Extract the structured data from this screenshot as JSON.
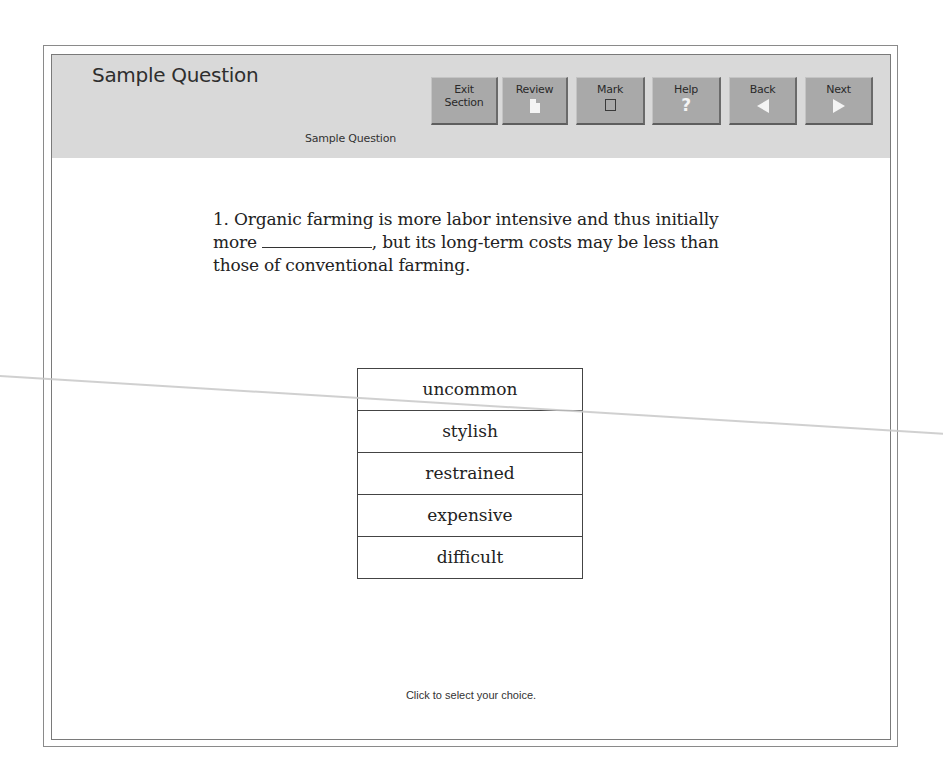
{
  "header": {
    "title": "Sample Question",
    "subtitle": "Sample Question"
  },
  "toolbar": {
    "buttons": [
      {
        "label_line1": "Exit",
        "label_line2": "Section",
        "icon": "none"
      },
      {
        "label": "Review",
        "icon": "document-icon"
      },
      {
        "label": "Mark",
        "icon": "checkbox-icon"
      },
      {
        "label": "Help",
        "icon": "question-mark-icon"
      },
      {
        "label": "Back",
        "icon": "arrow-left-icon"
      },
      {
        "label": "Next",
        "icon": "arrow-right-icon"
      }
    ]
  },
  "question": {
    "number": "1.",
    "text_before_blank": "Organic farming is more labor intensive and thus initially more",
    "text_after_blank": ", but its long-term costs may be less than those of conventional farming."
  },
  "choices": [
    {
      "label": "uncommon"
    },
    {
      "label": "stylish"
    },
    {
      "label": "restrained"
    },
    {
      "label": "expensive"
    },
    {
      "label": "difficult"
    }
  ],
  "footer": {
    "hint": "Click to select your choice."
  },
  "colors": {
    "header_bg": "#d9d9d9",
    "button_bg": "#a9a9a9",
    "icon_fg": "#f4f4f4",
    "frame_border": "#7a7a7a"
  }
}
